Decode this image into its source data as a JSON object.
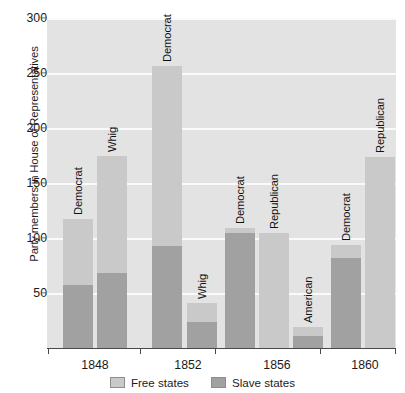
{
  "chart_data": {
    "type": "bar",
    "title": "",
    "subtitle": "",
    "xlabel": "",
    "ylabel": "Party members in House of Representatives",
    "ylim": [
      0,
      300
    ],
    "ytick_values": [
      50,
      100,
      150,
      200,
      250,
      300
    ],
    "ytick_labels": [
      "50",
      "100",
      "150",
      "200",
      "250",
      "300"
    ],
    "grid": true,
    "stacked": true,
    "legend_position": "bottom",
    "categories": [
      "1848",
      "1852",
      "1856",
      "1860"
    ],
    "series": [
      {
        "name": "Free states",
        "color": "#c9c9c9"
      },
      {
        "name": "Slave states",
        "color": "#a1a1a1"
      }
    ],
    "bars": [
      {
        "group": "1848",
        "label": "Democrat",
        "slave_states": 57,
        "free_states": 60,
        "total": 117
      },
      {
        "group": "1848",
        "label": "Whig",
        "slave_states": 68,
        "free_states": 107,
        "total": 175
      },
      {
        "group": "1852",
        "label": "Democrat",
        "slave_states": 93,
        "free_states": 163,
        "total": 256
      },
      {
        "group": "1852",
        "label": "Whig",
        "slave_states": 24,
        "free_states": 17,
        "total": 41
      },
      {
        "group": "1856",
        "label": "Democrat",
        "slave_states": 105,
        "free_states": 4,
        "total": 109
      },
      {
        "group": "1856",
        "label": "Republican",
        "slave_states": 0,
        "free_states": 105,
        "total": 105
      },
      {
        "group": "1856",
        "label": "American",
        "slave_states": 11,
        "free_states": 8,
        "total": 19
      },
      {
        "group": "1860",
        "label": "Democrat",
        "slave_states": 82,
        "free_states": 12,
        "total": 94
      },
      {
        "group": "1860",
        "label": "Republican",
        "slave_states": 0,
        "free_states": 174,
        "total": 174
      }
    ]
  },
  "axis": {
    "y_title": "Party members in House of Representatives"
  },
  "legend": {
    "items": [
      {
        "label": "Free states",
        "color": "#c9c9c9"
      },
      {
        "label": "Slave states",
        "color": "#a1a1a1"
      }
    ]
  },
  "colors": {
    "plot_background": "#e3e3e3",
    "gridline": "#fafafa",
    "free_states": "#c9c9c9",
    "slave_states": "#a1a1a1",
    "axis": "#4a4a4a",
    "text": "#1b1b1b"
  }
}
